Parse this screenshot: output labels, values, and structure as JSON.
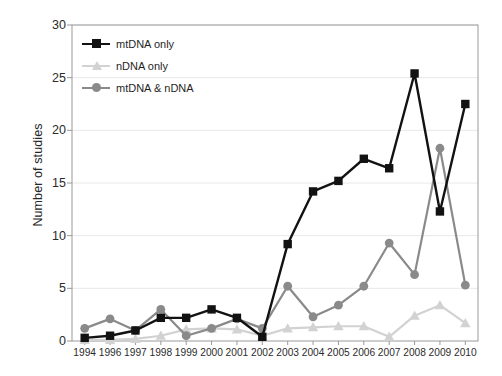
{
  "chart_data": {
    "type": "line",
    "title": "",
    "xlabel": "",
    "ylabel": "Number of studies",
    "xlim_categories": [
      "1994",
      "1996",
      "1997",
      "1998",
      "1999",
      "2000",
      "2001",
      "2002",
      "2003",
      "2004",
      "2005",
      "2006",
      "2007",
      "2008",
      "2009",
      "2010"
    ],
    "ylim": [
      0,
      30
    ],
    "yticks": [
      0,
      5,
      10,
      15,
      20,
      25,
      30
    ],
    "grid": "horizontal",
    "legend_position": "top-left inside plot area",
    "categories": [
      "1994",
      "1996",
      "1997",
      "1998",
      "1999",
      "2000",
      "2001",
      "2002",
      "2003",
      "2004",
      "2005",
      "2006",
      "2007",
      "2008",
      "2009",
      "2010"
    ],
    "series": [
      {
        "name": "mtDNA only",
        "color": "#121212",
        "marker": "square",
        "values": [
          0.3,
          0.5,
          1.0,
          2.2,
          2.2,
          3.0,
          2.2,
          0.4,
          9.2,
          14.2,
          15.2,
          17.3,
          16.4,
          25.4,
          12.3,
          22.5
        ]
      },
      {
        "name": "nDNA only",
        "color": "#d2d2d2",
        "marker": "triangle",
        "values": [
          0.1,
          0.1,
          0.2,
          0.5,
          1.1,
          1.2,
          1.1,
          0.5,
          1.2,
          1.3,
          1.4,
          1.4,
          0.4,
          2.4,
          3.4,
          1.7
        ]
      },
      {
        "name": "mtDNA & nDNA",
        "color": "#8a8a8a",
        "marker": "circle",
        "values": [
          1.2,
          2.1,
          1.0,
          3.0,
          0.5,
          1.2,
          2.1,
          1.2,
          5.2,
          2.3,
          3.4,
          5.2,
          9.3,
          6.3,
          18.3,
          5.3
        ]
      }
    ]
  },
  "legend": {
    "items": [
      {
        "label": "mtDNA only"
      },
      {
        "label": "nDNA only"
      },
      {
        "label": "mtDNA & nDNA"
      }
    ]
  },
  "axes": {
    "y_title": "Number of studies"
  },
  "colors": {
    "series_mtdna": "#121212",
    "series_ndna": "#d2d2d2",
    "series_both": "#8a8a8a",
    "axis": "#9a9a9a",
    "grid": "#e8e8e8",
    "text": "#1f1f1f"
  }
}
